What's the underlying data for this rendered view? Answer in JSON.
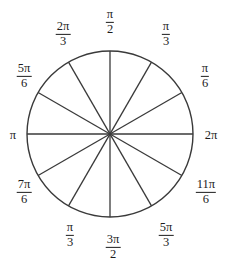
{
  "figure": {
    "type": "unit-circle-radian-wheel",
    "title": "",
    "stroke_color": "#3a3a3a",
    "label_color": "#1c1c1c",
    "background_color": "#ffffff",
    "circle": {
      "center_x": 110,
      "center_y": 134,
      "radius": 83
    },
    "spokes": {
      "count": 12,
      "angle_step_degrees": 30
    },
    "labels": [
      {
        "id": "pi-over-2",
        "numerator": "π",
        "denominator": "2",
        "is_fraction": true,
        "text": "π/2",
        "angle_degrees": 90,
        "x": 110,
        "y": 22
      },
      {
        "id": "pi-over-3",
        "numerator": "π",
        "denominator": "3",
        "is_fraction": true,
        "text": "π/3",
        "angle_degrees": 60,
        "x": 166,
        "y": 34
      },
      {
        "id": "pi-over-6",
        "numerator": "π",
        "denominator": "6",
        "is_fraction": true,
        "text": "π/6",
        "angle_degrees": 30,
        "x": 205,
        "y": 76
      },
      {
        "id": "two-pi",
        "numerator": "",
        "denominator": "",
        "is_fraction": false,
        "text": "2π",
        "angle_degrees": 0,
        "x": 211,
        "y": 135
      },
      {
        "id": "eleven-pi-over-6",
        "numerator": "11π",
        "denominator": "6",
        "is_fraction": true,
        "text": "11π/6",
        "angle_degrees": 330,
        "x": 206,
        "y": 192
      },
      {
        "id": "five-pi-over-3",
        "numerator": "5π",
        "denominator": "3",
        "is_fraction": true,
        "text": "5π/3",
        "angle_degrees": 300,
        "x": 166,
        "y": 235
      },
      {
        "id": "three-pi-over-2",
        "numerator": "3π",
        "denominator": "2",
        "is_fraction": true,
        "text": "3π/2",
        "angle_degrees": 270,
        "x": 113,
        "y": 247
      },
      {
        "id": "bottom-left-pi-over-3",
        "numerator": "π",
        "denominator": "3",
        "is_fraction": true,
        "text": "π/3",
        "angle_degrees": 240,
        "x": 70,
        "y": 235
      },
      {
        "id": "seven-pi-over-6",
        "numerator": "7π",
        "denominator": "6",
        "is_fraction": true,
        "text": "7π/6",
        "angle_degrees": 210,
        "x": 24,
        "y": 192
      },
      {
        "id": "pi",
        "numerator": "",
        "denominator": "",
        "is_fraction": false,
        "text": "π",
        "angle_degrees": 180,
        "x": 13,
        "y": 135
      },
      {
        "id": "five-pi-over-6",
        "numerator": "5π",
        "denominator": "6",
        "is_fraction": true,
        "text": "5π/6",
        "angle_degrees": 150,
        "x": 24,
        "y": 76
      },
      {
        "id": "two-pi-over-3",
        "numerator": "2π",
        "denominator": "3",
        "is_fraction": true,
        "text": "2π/3",
        "angle_degrees": 120,
        "x": 63,
        "y": 34
      }
    ]
  }
}
